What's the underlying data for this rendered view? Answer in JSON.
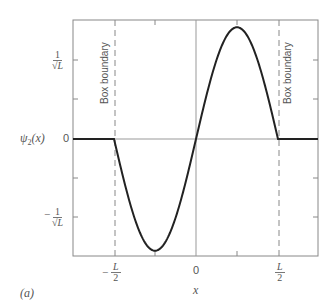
{
  "panel_label": "(a)",
  "chart_data": {
    "type": "line",
    "title": "",
    "xlabel": "x",
    "ylabel": "ψ2(x)",
    "x_ticks": [
      {
        "value": -0.5,
        "label": "-L/2"
      },
      {
        "value": 0,
        "label": "0"
      },
      {
        "value": 0.5,
        "label": "L/2"
      }
    ],
    "y_ticks": [
      {
        "value": 1,
        "label": "1/√L"
      },
      {
        "value": 0,
        "label": "0"
      },
      {
        "value": -1,
        "label": "-1/√L"
      }
    ],
    "xlim": [
      -1,
      1
    ],
    "ylim": [
      -1.5,
      1.5
    ],
    "x_units": "L",
    "y_units": "1/√L",
    "function": "ψ2(x) = √(2/L) sin(2πx/L) for |x| ≤ L/2, 0 otherwise",
    "series": [
      {
        "name": "ψ2(x)",
        "x": [
          -1,
          -0.5,
          -0.375,
          -0.25,
          -0.125,
          0,
          0.125,
          0.25,
          0.375,
          0.5,
          1
        ],
        "values": [
          0,
          0,
          -1.0,
          -1.414,
          -1.0,
          0,
          1.0,
          1.414,
          1.0,
          0,
          0
        ]
      }
    ],
    "annotations": [
      {
        "text": "Box boundary",
        "x": -0.5,
        "style": "dashed vertical line"
      },
      {
        "text": "Box boundary",
        "x": 0.5,
        "style": "dashed vertical line"
      }
    ],
    "grid": false,
    "legend": "none"
  },
  "labels": {
    "ylabel_main": "ψ",
    "ylabel_sub": "2",
    "ylabel_arg": "(x)",
    "xlabel": "x",
    "box_boundary_left": "Box boundary",
    "box_boundary_right": "Box boundary",
    "y_zero": "0",
    "x_zero": "0",
    "one": "1",
    "sqrtL": "√L",
    "minus": "−",
    "L": "L",
    "two": "2"
  }
}
